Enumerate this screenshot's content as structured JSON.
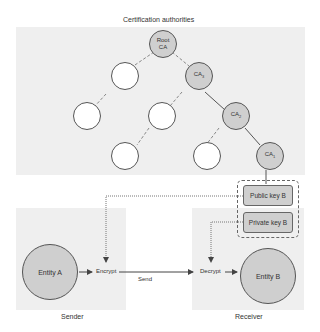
{
  "title": "Certification authorities",
  "ca_tree": {
    "root": {
      "line1": "Root",
      "line2": "CA"
    },
    "ca3": {
      "base": "CA",
      "sub": "3"
    },
    "ca2": {
      "base": "CA",
      "sub": "2"
    },
    "ca1": {
      "base": "CA",
      "sub": "1"
    }
  },
  "keys": {
    "public": "Public key B",
    "private": "Private key B"
  },
  "sender": {
    "label": "Sender",
    "entity": "Entity A",
    "action": "Encrypt"
  },
  "receiver": {
    "label": "Receiver",
    "entity": "Entity B",
    "action": "Decrypt"
  },
  "transfer": {
    "label": "Send"
  },
  "colors": {
    "panel": "#efefef",
    "node_fill": "#cfcfcf",
    "stroke": "#555555"
  }
}
